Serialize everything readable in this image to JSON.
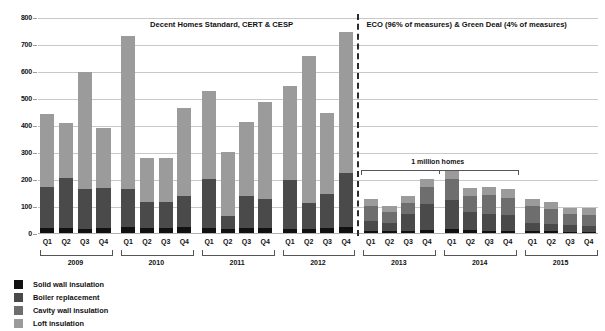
{
  "chart_data": {
    "type": "bar",
    "title": "",
    "subtitle": "",
    "xlabel": "",
    "ylabel": "",
    "ylim": [
      0,
      800
    ],
    "ytick_values": [
      0,
      100,
      200,
      300,
      400,
      500,
      600,
      700,
      800
    ],
    "ytick_labels": [
      "0",
      "100",
      "200",
      "300",
      "400",
      "500",
      "600",
      "700",
      "800"
    ],
    "grid": true,
    "stacked": true,
    "legend_position": "bottom-left",
    "categories": [
      "2009 Q1",
      "2009 Q2",
      "2009 Q3",
      "2009 Q4",
      "2010 Q1",
      "2010 Q2",
      "2010 Q3",
      "2010 Q4",
      "2011 Q1",
      "2011 Q2",
      "2011 Q3",
      "2011 Q4",
      "2012 Q1",
      "2012 Q2",
      "2012 Q3",
      "2012 Q4",
      "2013 Q1",
      "2013 Q2",
      "2013 Q3",
      "2013 Q4",
      "2014 Q1",
      "2014 Q2",
      "2014 Q3",
      "2014 Q4",
      "2015 Q1",
      "2015 Q2",
      "2015 Q3",
      "2015 Q4"
    ],
    "quarter_labels": [
      "Q1",
      "Q2",
      "Q3",
      "Q4"
    ],
    "years": [
      "2009",
      "2010",
      "2011",
      "2012",
      "2013",
      "2014",
      "2015"
    ],
    "series": [
      {
        "name": "Solid wall insulation",
        "color": "#111111",
        "values": [
          22,
          22,
          20,
          22,
          25,
          22,
          22,
          25,
          22,
          20,
          22,
          22,
          20,
          18,
          22,
          26,
          12,
          10,
          12,
          16,
          18,
          14,
          12,
          12,
          10,
          10,
          9,
          9
        ]
      },
      {
        "name": "Boiler replacement",
        "color": "#4a4a4a",
        "values": [
          152,
          186,
          148,
          150,
          140,
          95,
          96,
          116,
          182,
          48,
          118,
          108,
          180,
          98,
          126,
          200,
          38,
          32,
          62,
          96,
          108,
          66,
          62,
          58,
          30,
          28,
          24,
          22
        ]
      },
      {
        "name": "Cavity wall insulation",
        "color": "#6e6e6e",
        "values": [
          0,
          0,
          0,
          0,
          0,
          0,
          0,
          0,
          0,
          0,
          0,
          0,
          0,
          0,
          0,
          0,
          54,
          38,
          40,
          62,
          78,
          62,
          70,
          62,
          62,
          56,
          40,
          40
        ]
      },
      {
        "name": "Loft insulation",
        "color": "#9b9b9b",
        "values": [
          269,
          203,
          432,
          222,
          568,
          164,
          163,
          326,
          325,
          237,
          275,
          359,
          348,
          545,
          300,
          524,
          26,
          25,
          26,
          31,
          28,
          28,
          31,
          33,
          28,
          26,
          25,
          24
        ]
      }
    ],
    "totals": [
      443,
      411,
      600,
      394,
      733,
      281,
      281,
      467,
      529,
      305,
      415,
      489,
      548,
      661,
      448,
      750,
      130,
      105,
      140,
      205,
      232,
      170,
      175,
      165,
      130,
      120,
      98,
      95
    ],
    "annotations": [
      {
        "id": "left-policy-label",
        "text": "Decent Homes Standard, CERT & CESP"
      },
      {
        "id": "right-policy-label",
        "text": "ECO (96% of measures) & Green Deal (4% of measures)"
      },
      {
        "id": "million-homes-label",
        "text": "1 million homes"
      }
    ],
    "divider": {
      "after_category": "2012 Q4",
      "style": "dashed"
    }
  }
}
